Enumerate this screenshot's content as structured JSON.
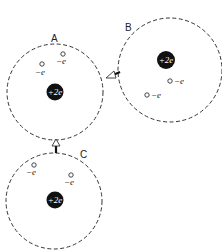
{
  "atoms": [
    {
      "label": "A",
      "nucleus_charge": "+2e",
      "electrons": [
        {
          "label": "−e"
        },
        {
          "label": "−e"
        }
      ]
    },
    {
      "label": "B",
      "nucleus_charge": "+2e",
      "electrons": [
        {
          "label": "−e"
        },
        {
          "label": "−e"
        }
      ]
    },
    {
      "label": "C",
      "nucleus_charge": "+2e",
      "electrons": [
        {
          "label": "−e"
        },
        {
          "label": "−e"
        }
      ]
    }
  ],
  "arrows": [
    {
      "from": "B",
      "to": "A"
    },
    {
      "from": "C",
      "to": "A"
    }
  ],
  "colors": {
    "line": "#333333",
    "nucleus": "#111111",
    "background": "#ffffff"
  }
}
